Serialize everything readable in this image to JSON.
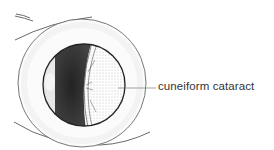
{
  "diagram": {
    "labels": [
      {
        "text": "cuneiform cataract",
        "target": "lens-opacity"
      }
    ]
  },
  "colors": {
    "line": "#3a3a3a",
    "dark_shading": "#2a2a2a",
    "background": "#ffffff"
  }
}
